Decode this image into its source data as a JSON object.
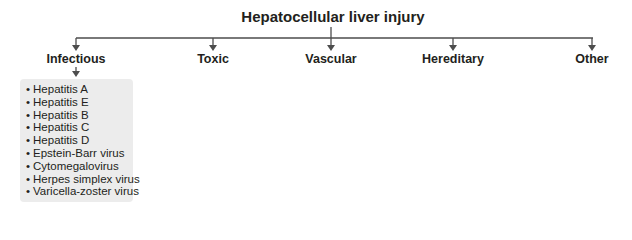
{
  "diagram": {
    "title": "Hepatocellular liver injury",
    "categories": [
      {
        "label": "Infectious",
        "x": 76
      },
      {
        "label": "Toxic",
        "x": 213
      },
      {
        "label": "Vascular",
        "x": 331
      },
      {
        "label": "Hereditary",
        "x": 453
      },
      {
        "label": "Other",
        "x": 592
      }
    ],
    "infectious_items": [
      "Hepatitis A",
      "Hepatitis E",
      "Hepatitis B",
      "Hepatitis C",
      "Hepatitis D",
      "Epstein-Barr virus",
      "Cytomegalovirus",
      "Herpes simplex virus",
      "Varicella-zoster virus"
    ],
    "colors": {
      "line": "#4d4d4d",
      "box": "#ececec",
      "text": "#231f20"
    }
  }
}
